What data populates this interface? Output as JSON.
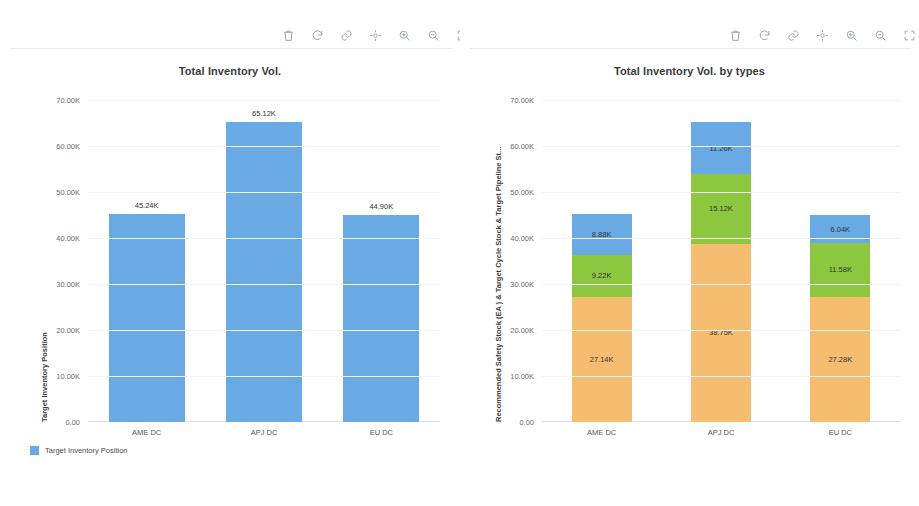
{
  "toolbar": {
    "icons": [
      {
        "name": "trash-icon",
        "label": "Delete"
      },
      {
        "name": "refresh-icon",
        "label": "Refresh"
      },
      {
        "name": "link-icon",
        "label": "Link"
      },
      {
        "name": "pan-icon",
        "label": "Pan"
      },
      {
        "name": "zoom-in-icon",
        "label": "Zoom In"
      },
      {
        "name": "zoom-out-icon",
        "label": "Zoom Out"
      },
      {
        "name": "fullscreen-icon",
        "label": "Fullscreen"
      }
    ]
  },
  "colors": {
    "blue": "#6aaae4",
    "green": "#8dc63f",
    "orange": "#f4bd70",
    "grid": "#f2f3f5",
    "axis": "#dadde1",
    "icon": "#97a5bb"
  },
  "chart_data": [
    {
      "type": "bar",
      "title": "Total Inventory Vol.",
      "xlabel": "",
      "ylabel": "Target Inventory Position",
      "categories": [
        "AME DC",
        "APJ DC",
        "EU DC"
      ],
      "values": [
        45240,
        65120,
        44900
      ],
      "value_labels": [
        "45.24K",
        "65.12K",
        "44.90K"
      ],
      "ylim": [
        0,
        70000
      ],
      "yticks": [
        0,
        10000,
        20000,
        30000,
        40000,
        50000,
        60000,
        70000
      ],
      "ytick_labels": [
        "0.00",
        "10.00K",
        "20.00K",
        "30.00K",
        "40.00K",
        "50.00K",
        "60.00K",
        "70.00K"
      ],
      "grid": true,
      "legend_position": "bottom-left",
      "legend": [
        {
          "name": "Target Inventory Position",
          "color": "#6aaae4"
        }
      ]
    },
    {
      "type": "bar",
      "stacked": true,
      "title": "Total Inventory Vol. by types",
      "xlabel": "",
      "ylabel": "Recommended Safety Stock (EA ) & Target Cycle Stock & Target Pipeline St...",
      "categories": [
        "AME DC",
        "APJ DC",
        "EU DC"
      ],
      "ylim": [
        0,
        70000
      ],
      "yticks": [
        0,
        10000,
        20000,
        30000,
        40000,
        50000,
        60000,
        70000
      ],
      "ytick_labels": [
        "0.00",
        "10.00K",
        "20.00K",
        "30.00K",
        "40.00K",
        "50.00K",
        "60.00K",
        "70.00K"
      ],
      "grid": true,
      "legend_position": "bottom-left",
      "series": [
        {
          "name": "Target Pipeline Stock",
          "color": "#f4bd70",
          "values": [
            27140,
            38750,
            27280
          ],
          "value_labels": [
            "27.14K",
            "38.75K",
            "27.28K"
          ]
        },
        {
          "name": "Target Cycle Stock",
          "color": "#8dc63f",
          "values": [
            9220,
            15120,
            11580
          ],
          "value_labels": [
            "9.22K",
            "15.12K",
            "11.58K"
          ]
        },
        {
          "name": "Recommended Safety Stock",
          "color": "#6aaae4",
          "values": [
            8880,
            11260,
            6040
          ],
          "value_labels": [
            "8.88K",
            "11.26K",
            "6.04K"
          ]
        }
      ],
      "legend": [
        {
          "name": "Recommended Safety Stock",
          "color": "#6aaae4"
        },
        {
          "name": "Target Cycle Stock",
          "color": "#8dc63f"
        },
        {
          "name": "Target Pipeline Stock",
          "color": "#f4bd70"
        }
      ]
    }
  ]
}
